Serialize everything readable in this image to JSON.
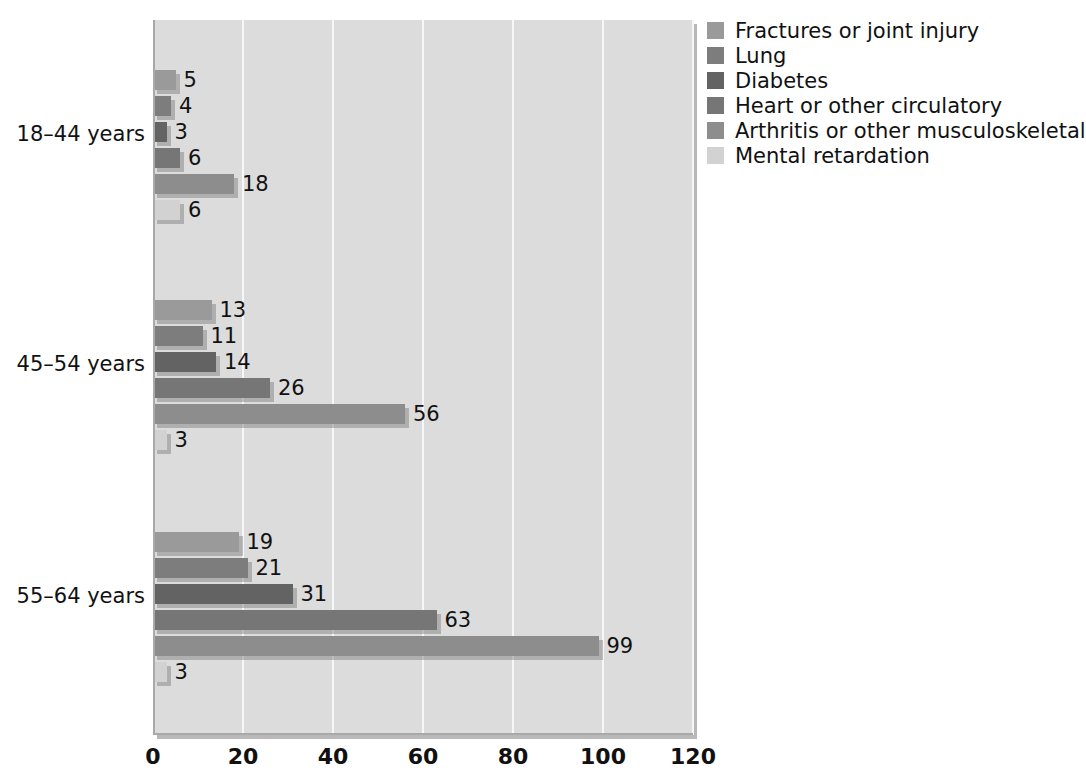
{
  "chart_data": {
    "type": "bar",
    "orientation": "horizontal",
    "title": "",
    "xlabel": "",
    "ylabel": "",
    "xlim": [
      0,
      120
    ],
    "xticks": [
      0,
      20,
      40,
      60,
      80,
      100,
      120
    ],
    "grid": true,
    "legend_position": "right",
    "categories": [
      "18–44 years",
      "45–54 years",
      "55–64 years"
    ],
    "series": [
      {
        "name": "Fractures or joint injury",
        "color": "#9a9a9a",
        "values": [
          5,
          13,
          19
        ]
      },
      {
        "name": "Lung",
        "color": "#7d7d7d",
        "values": [
          4,
          11,
          21
        ]
      },
      {
        "name": "Diabetes",
        "color": "#636363",
        "values": [
          3,
          14,
          31
        ]
      },
      {
        "name": "Heart or other circulatory",
        "color": "#767676",
        "values": [
          6,
          26,
          63
        ]
      },
      {
        "name": "Arthritis or other musculoskeletal",
        "color": "#8d8d8d",
        "values": [
          18,
          56,
          99
        ]
      },
      {
        "name": "Mental retardation",
        "color": "#d2d2d2",
        "values": [
          6,
          3,
          3
        ]
      }
    ],
    "data_labels": [
      [
        5,
        4,
        3,
        6,
        18,
        6
      ],
      [
        13,
        11,
        14,
        26,
        56,
        3
      ],
      [
        19,
        21,
        31,
        63,
        99,
        3
      ]
    ],
    "colors": {
      "plot_background": "#dcdcdc",
      "gridline": "#f7f7f7",
      "axis": "#a9a9a9",
      "text": "#111111",
      "page_background": "#ffffff"
    }
  },
  "legend": {
    "items": [
      {
        "label": "Fractures or joint injury",
        "color": "#9a9a9a"
      },
      {
        "label": "Lung",
        "color": "#7d7d7d"
      },
      {
        "label": "Diabetes",
        "color": "#636363"
      },
      {
        "label": "Heart or other circulatory",
        "color": "#767676"
      },
      {
        "label": "Arthritis or other musculoskeletal",
        "color": "#8d8d8d"
      },
      {
        "label": "Mental retardation",
        "color": "#d2d2d2"
      }
    ]
  },
  "axis": {
    "x_tick_labels": [
      "0",
      "20",
      "40",
      "60",
      "80",
      "100",
      "120"
    ],
    "y_category_labels": [
      "18–44 years",
      "45–54 years",
      "55–64 years"
    ]
  }
}
